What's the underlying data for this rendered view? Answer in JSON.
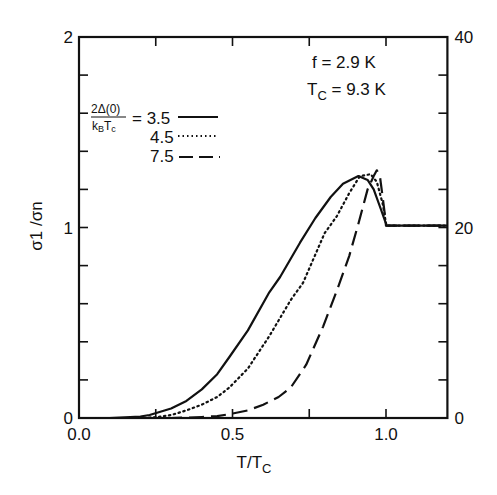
{
  "chart_data": {
    "type": "line",
    "title": "",
    "xlabel": "T/T_C",
    "ylabel": "σ1 /σn",
    "xlim": [
      0,
      1.2
    ],
    "ylim": [
      0,
      2
    ],
    "y2lim": [
      0,
      40
    ],
    "grid": false,
    "x_ticks": [
      {
        "value": 0.0,
        "label": "0.0"
      },
      {
        "value": 0.5,
        "label": "0.5"
      },
      {
        "value": 1.0,
        "label": "1.0"
      }
    ],
    "x_minor_ticks": [
      0.25,
      0.75
    ],
    "y_ticks": [
      {
        "value": 0,
        "label": "0"
      },
      {
        "value": 1,
        "label": "1"
      },
      {
        "value": 2,
        "label": "2"
      }
    ],
    "y_minor_step": 0.2,
    "y2_ticks": [
      {
        "value": 0,
        "label": "0"
      },
      {
        "value": 20,
        "label": "20"
      },
      {
        "value": 40,
        "label": "40"
      }
    ],
    "y2_minor_step": 4,
    "annotations": {
      "freq": "f = 2.9 K",
      "tc_prefix": "T",
      "tc_sub": "C",
      "tc_value": " = 9.3 K"
    },
    "legend": {
      "title_numerator": "2Δ(0)",
      "title_denominator_k": "k",
      "title_denominator_b": "B",
      "title_denominator_t": "T",
      "title_denominator_c": "c",
      "position": "upper-left",
      "entries": [
        {
          "label": "= 3.5",
          "style": "solid"
        },
        {
          "label": "4.5",
          "style": "dotted"
        },
        {
          "label": "7.5",
          "style": "dashed"
        }
      ]
    },
    "series": [
      {
        "name": "2Δ(0)/kBTc = 3.5",
        "style": "solid",
        "x": [
          0.0,
          0.1,
          0.15,
          0.2,
          0.23,
          0.3,
          0.35,
          0.4,
          0.45,
          0.49,
          0.55,
          0.62,
          0.655,
          0.72,
          0.77,
          0.82,
          0.86,
          0.91,
          0.94,
          0.96,
          0.98,
          1.0,
          1.0,
          1.2
        ],
        "y": [
          0.0,
          0.0,
          0.003,
          0.008,
          0.016,
          0.05,
          0.09,
          0.15,
          0.23,
          0.32,
          0.46,
          0.66,
          0.74,
          0.92,
          1.05,
          1.16,
          1.23,
          1.27,
          1.25,
          1.2,
          1.11,
          1.02,
          1.01,
          1.01
        ]
      },
      {
        "name": "2Δ(0)/kBTc = 4.5",
        "style": "dotted",
        "x": [
          0.0,
          0.2,
          0.25,
          0.3,
          0.35,
          0.4,
          0.45,
          0.49,
          0.55,
          0.62,
          0.69,
          0.73,
          0.8,
          0.84,
          0.88,
          0.915,
          0.95,
          0.97,
          0.99,
          1.0,
          1.0,
          1.2
        ],
        "y": [
          0.0,
          0.0,
          0.004,
          0.015,
          0.04,
          0.07,
          0.11,
          0.16,
          0.26,
          0.43,
          0.62,
          0.71,
          0.97,
          1.06,
          1.18,
          1.27,
          1.28,
          1.24,
          1.12,
          1.02,
          1.01,
          1.01
        ]
      },
      {
        "name": "2Δ(0)/kBTc = 7.5",
        "style": "dashed",
        "x": [
          0.0,
          0.3,
          0.35,
          0.4,
          0.45,
          0.49,
          0.55,
          0.6,
          0.65,
          0.69,
          0.74,
          0.795,
          0.84,
          0.88,
          0.91,
          0.94,
          0.96,
          0.97,
          0.98,
          0.99,
          1.0,
          1.0,
          1.2
        ],
        "y": [
          0.0,
          0.0,
          0.002,
          0.005,
          0.01,
          0.02,
          0.04,
          0.07,
          0.11,
          0.16,
          0.28,
          0.48,
          0.67,
          0.85,
          1.02,
          1.2,
          1.27,
          1.3,
          1.27,
          1.15,
          1.02,
          1.01,
          1.01
        ]
      }
    ]
  }
}
